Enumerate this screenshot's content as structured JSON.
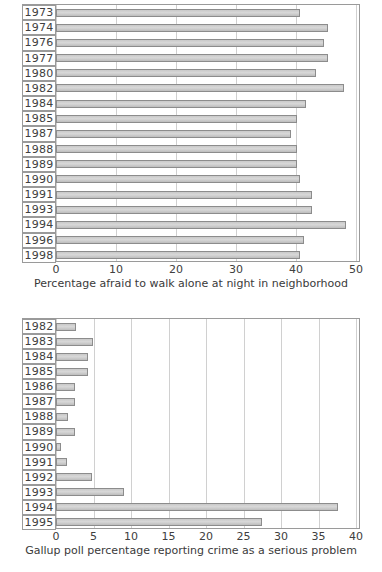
{
  "chart_data": [
    {
      "type": "bar",
      "orientation": "horizontal",
      "title": "",
      "xlabel": "Percentage afraid to walk alone at night in neighborhood",
      "ylabel": "",
      "xlim": [
        0,
        50
      ],
      "xticks": [
        0,
        10,
        20,
        30,
        40,
        50
      ],
      "xticklabels": [
        "0",
        "10",
        "20",
        "30",
        "40",
        "50"
      ],
      "grid": true,
      "grid_axis": "x",
      "legend": "none",
      "categories": [
        "1973",
        "1974",
        "1976",
        "1977",
        "1980",
        "1982",
        "1984",
        "1985",
        "1987",
        "1988",
        "1989",
        "1990",
        "1991",
        "1993",
        "1994",
        "1996",
        "1998"
      ],
      "values": [
        40.7,
        45.3,
        44.6,
        45.3,
        43.4,
        48.0,
        41.7,
        40.2,
        39.1,
        40.2,
        40.2,
        40.6,
        42.6,
        42.6,
        48.4,
        41.4,
        40.6
      ]
    },
    {
      "type": "bar",
      "orientation": "horizontal",
      "title": "",
      "xlabel": "Gallup poll percentage reporting crime as a serious problem",
      "ylabel": "",
      "xlim": [
        0,
        40
      ],
      "xticks": [
        0,
        5,
        10,
        15,
        20,
        25,
        30,
        35,
        40
      ],
      "xticklabels": [
        "0",
        "5",
        "10",
        "15",
        "20",
        "25",
        "30",
        "35",
        "40"
      ],
      "grid": true,
      "grid_axis": "x",
      "legend": "none",
      "categories": [
        "1982",
        "1983",
        "1984",
        "1985",
        "1986",
        "1987",
        "1988",
        "1989",
        "1990",
        "1991",
        "1992",
        "1993",
        "1994",
        "1995"
      ],
      "values": [
        2.6,
        4.9,
        4.3,
        4.2,
        2.5,
        2.5,
        1.6,
        2.5,
        0.6,
        1.5,
        4.8,
        9.1,
        37.6,
        27.4
      ]
    }
  ],
  "charts": [
    {
      "name": "fear-of-crime-chart",
      "axis_title": "Percentage afraid to walk alone at night in neighborhood",
      "ticks": [
        "0",
        "10",
        "20",
        "30",
        "40",
        "50"
      ],
      "rows": [
        {
          "label": "1973",
          "value": 40.7
        },
        {
          "label": "1974",
          "value": 45.3
        },
        {
          "label": "1976",
          "value": 44.6
        },
        {
          "label": "1977",
          "value": 45.3
        },
        {
          "label": "1980",
          "value": 43.4
        },
        {
          "label": "1982",
          "value": 48.0
        },
        {
          "label": "1984",
          "value": 41.7
        },
        {
          "label": "1985",
          "value": 40.2
        },
        {
          "label": "1987",
          "value": 39.1
        },
        {
          "label": "1988",
          "value": 40.2
        },
        {
          "label": "1989",
          "value": 40.2
        },
        {
          "label": "1990",
          "value": 40.6
        },
        {
          "label": "1991",
          "value": 42.6
        },
        {
          "label": "1993",
          "value": 42.6
        },
        {
          "label": "1994",
          "value": 48.4
        },
        {
          "label": "1996",
          "value": 41.4
        },
        {
          "label": "1998",
          "value": 40.6
        }
      ]
    },
    {
      "name": "gallup-crime-serious-problem-chart",
      "axis_title": "Gallup poll percentage reporting crime as a serious problem",
      "ticks": [
        "0",
        "5",
        "10",
        "15",
        "20",
        "25",
        "30",
        "35",
        "40"
      ],
      "rows": [
        {
          "label": "1982",
          "value": 2.6
        },
        {
          "label": "1983",
          "value": 4.9
        },
        {
          "label": "1984",
          "value": 4.3
        },
        {
          "label": "1985",
          "value": 4.2
        },
        {
          "label": "1986",
          "value": 2.5
        },
        {
          "label": "1987",
          "value": 2.5
        },
        {
          "label": "1988",
          "value": 1.6
        },
        {
          "label": "1989",
          "value": 2.5
        },
        {
          "label": "1990",
          "value": 0.6
        },
        {
          "label": "1991",
          "value": 1.5
        },
        {
          "label": "1992",
          "value": 4.8
        },
        {
          "label": "1993",
          "value": 9.1
        },
        {
          "label": "1994",
          "value": 37.6
        },
        {
          "label": "1995",
          "value": 27.4
        }
      ]
    }
  ],
  "colors": {
    "bar_fill": "#d4d4d4",
    "bar_stroke": "#8c8c8c",
    "frame": "#9a9a9a",
    "grid": "#d0d0d0",
    "text": "#3a3a3a",
    "background": "#ffffff"
  }
}
